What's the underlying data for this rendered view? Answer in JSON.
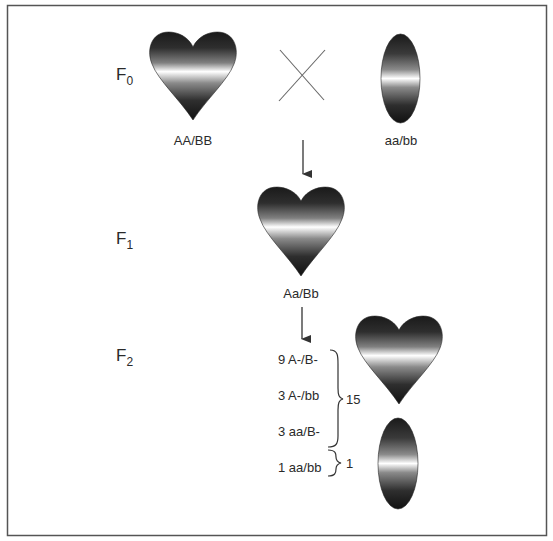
{
  "diagram": {
    "type": "genetic-cross",
    "generations": [
      {
        "id": "F0",
        "label_main": "F",
        "label_sub": "0",
        "parents": [
          {
            "shape": "heart",
            "genotype": "AA/BB"
          },
          {
            "shape": "oval",
            "genotype": "aa/bb"
          }
        ],
        "cross_symbol": "×"
      },
      {
        "id": "F1",
        "label_main": "F",
        "label_sub": "1",
        "offspring": [
          {
            "shape": "heart",
            "genotype": "Aa/Bb"
          }
        ]
      },
      {
        "id": "F2",
        "label_main": "F",
        "label_sub": "2",
        "classes": [
          {
            "count": 9,
            "genotype": "A-/B-",
            "text": "9 A-/B-"
          },
          {
            "count": 3,
            "genotype": "A-/bb",
            "text": "3 A-/bb"
          },
          {
            "count": 3,
            "genotype": "aa/B-",
            "text": "3 aa/B-"
          },
          {
            "count": 1,
            "genotype": "aa/bb",
            "text": "1 aa/bb"
          }
        ],
        "groups": [
          {
            "total": "15",
            "phenotype": "heart",
            "members": [
              "9 A-/B-",
              "3 A-/bb",
              "3 aa/B-"
            ]
          },
          {
            "total": "1",
            "phenotype": "oval",
            "members": [
              "1 aa/bb"
            ]
          }
        ]
      }
    ],
    "colors": {
      "border": "#555555",
      "text": "#2a2a2a",
      "shape_dark": "#1a1a1a",
      "shape_light": "#ffffff",
      "line": "#555555"
    }
  }
}
